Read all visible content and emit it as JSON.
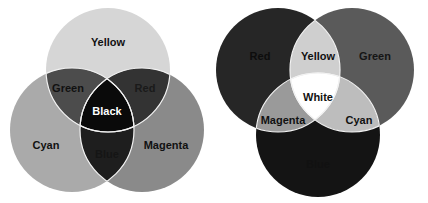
{
  "diagrams": [
    {
      "name": "subtractive-color-mixing",
      "circles": [
        {
          "label": "Yellow",
          "fill": "#d6d6d6",
          "cx": 108,
          "cy": 70,
          "r": 62
        },
        {
          "label": "Cyan",
          "fill": "#aaaaaa",
          "cx": 72,
          "cy": 130,
          "r": 62
        },
        {
          "label": "Magenta",
          "fill": "#8a8a8a",
          "cx": 142,
          "cy": 130,
          "r": 62
        }
      ],
      "regions": {
        "yellow": "Yellow",
        "cyan": "Cyan",
        "magenta": "Magenta",
        "green": "Green",
        "red": "Red",
        "blue": "Blue",
        "center": "Black"
      },
      "region_colors": {
        "green": "#4c4c4c",
        "red": "#333333",
        "blue": "#1e1e1e",
        "center": "#0a0a0a"
      }
    },
    {
      "name": "additive-color-mixing",
      "circles": [
        {
          "label": "Red",
          "fill": "#262626",
          "cx": 278,
          "cy": 70,
          "r": 62
        },
        {
          "label": "Green",
          "fill": "#5a5a5a",
          "cx": 352,
          "cy": 70,
          "r": 62
        },
        {
          "label": "Blue",
          "fill": "#141414",
          "cx": 318,
          "cy": 135,
          "r": 62
        }
      ],
      "regions": {
        "red": "Red",
        "green": "Green",
        "blue": "Blue",
        "yellow": "Yellow",
        "magenta": "Magenta",
        "cyan": "Cyan",
        "center": "White"
      },
      "region_colors": {
        "yellow": "#cfcfcf",
        "magenta": "#9a9a9a",
        "cyan": "#bdbdbd",
        "center": "#ffffff"
      }
    }
  ]
}
